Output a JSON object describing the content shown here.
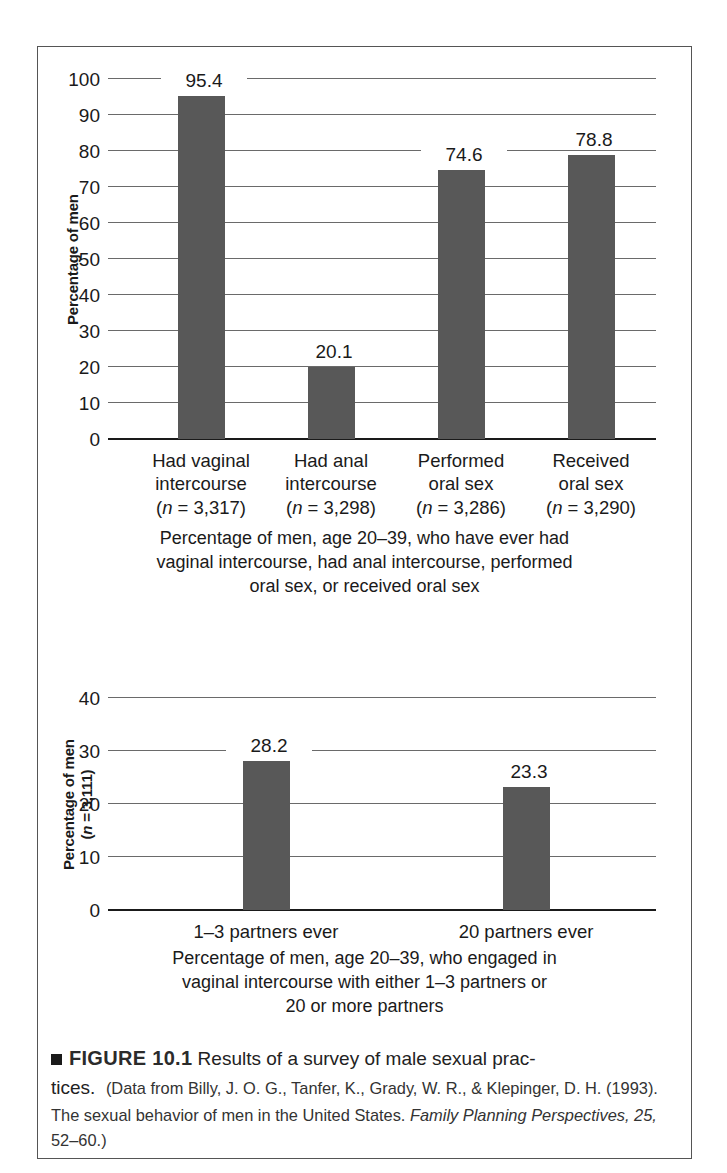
{
  "figure": {
    "marker_icon": "black-square-bullet",
    "number_label": "FIGURE 10.1",
    "lead_text": "Results of a survey of male sexual prac-tices.",
    "lead_text_line1": "Results of a survey of male sexual prac-",
    "lead_text_line2": "tices.",
    "source_open": "(Data from Billy, J. O. G., Tanfer, K., Grady, W. R., & Klepinger, D. H. (1993). The sexual behavior of men in the United States. ",
    "source_journal": "Family Planning Perspectives, 25,",
    "source_close": " 52–60.)"
  },
  "chart_data": [
    {
      "id": "top-chart",
      "type": "bar",
      "title": "",
      "categories": [
        "Had vaginal intercourse",
        "Had anal intercourse",
        "Performed oral sex",
        "Received oral sex"
      ],
      "category_lines": [
        [
          "Had vaginal",
          "intercourse",
          "(n = 3,317)"
        ],
        [
          "Had anal",
          "intercourse",
          "(n = 3,298)"
        ],
        [
          "Performed",
          "oral sex",
          "(n = 3,286)"
        ],
        [
          "Received",
          "oral sex",
          "(n = 3,290)"
        ]
      ],
      "sample_sizes": [
        3317,
        3298,
        3286,
        3290
      ],
      "values": [
        95.4,
        20.1,
        74.6,
        78.8
      ],
      "value_labels": [
        "95.4",
        "20.1",
        "74.6",
        "78.8"
      ],
      "xlabel": "",
      "ylabel": "Percentage of men",
      "ylabel_lines": [
        "Percentage of men"
      ],
      "ylim": [
        0,
        100
      ],
      "yticks": [
        0,
        10,
        20,
        30,
        40,
        50,
        60,
        70,
        80,
        90,
        100
      ],
      "ytick_labels": [
        "0",
        "10",
        "20",
        "30",
        "40",
        "50",
        "60",
        "70",
        "80",
        "90",
        "100"
      ],
      "grid": true,
      "legend": "none",
      "bar_color": "#585858",
      "caption_lines": [
        "Percentage of men, age 20–39, who have ever had",
        "vaginal intercourse, had anal intercourse, performed",
        "oral sex, or received oral sex"
      ]
    },
    {
      "id": "bottom-chart",
      "type": "bar",
      "title": "",
      "categories": [
        "1–3 partners ever",
        "20 partners ever"
      ],
      "category_lines": [
        [
          "1–3 partners ever"
        ],
        [
          "20 partners ever"
        ]
      ],
      "values": [
        28.2,
        23.3
      ],
      "value_labels": [
        "28.2",
        "23.3"
      ],
      "xlabel": "",
      "ylabel": "Percentage of men (n = 3,111)",
      "ylabel_lines": [
        "Percentage of men",
        "(n = 3,111)"
      ],
      "sample_size": 3111,
      "ylim": [
        0,
        40
      ],
      "yticks": [
        0,
        10,
        20,
        30,
        40
      ],
      "ytick_labels": [
        "0",
        "10",
        "20",
        "30",
        "40"
      ],
      "grid": true,
      "legend": "none",
      "bar_color": "#585858",
      "caption_lines": [
        "Percentage of men, age 20–39, who engaged in",
        "vaginal intercourse with either 1–3 partners or",
        "20 or more partners"
      ]
    }
  ]
}
